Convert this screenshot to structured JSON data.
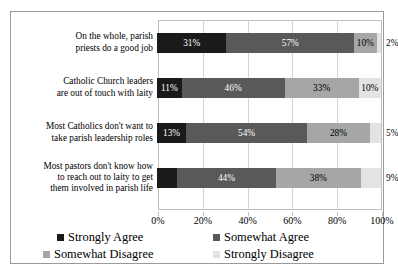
{
  "chart_data": {
    "type": "bar",
    "subtype": "stacked-horizontal-100pct",
    "title": "",
    "xlabel": "",
    "ylabel": "",
    "xlim": [
      0,
      100
    ],
    "xticks": [
      0,
      20,
      40,
      60,
      80,
      100
    ],
    "xtick_labels": [
      "0%",
      "20%",
      "40%",
      "60%",
      "80%",
      "100%"
    ],
    "grid": true,
    "grid_axis": "x",
    "legend_position": "bottom",
    "categories": [
      "On the whole, parish\npriests do a good job",
      "Catholic Church leaders\nare out of touch with laity",
      "Most Catholics don't want to\ntake parish leadership roles",
      "Most pastors don't know how\nto reach out to laity to get\nthem involved in parish life"
    ],
    "series": [
      {
        "name": "Strongly Agree",
        "color": "#1a1a1a",
        "values": [
          31,
          11,
          13,
          9
        ],
        "labels": [
          "31%",
          "11%",
          "13%",
          "9%"
        ]
      },
      {
        "name": "Somewhat Agree",
        "color": "#595959",
        "values": [
          57,
          46,
          54,
          44
        ],
        "labels": [
          "57%",
          "46%",
          "54%",
          "44%"
        ]
      },
      {
        "name": "Somewhat Disagree",
        "color": "#a6a6a6",
        "values": [
          10,
          33,
          28,
          38
        ],
        "labels": [
          "10%",
          "33%",
          "28%",
          "38%"
        ]
      },
      {
        "name": "Strongly Disagree",
        "color": "#e3e3e3",
        "values": [
          2,
          10,
          5,
          9
        ],
        "labels": [
          "2%",
          "10%",
          "5%",
          "9%"
        ]
      }
    ]
  },
  "legend": {
    "entries": [
      {
        "label": "Strongly Agree",
        "color": "#1a1a1a"
      },
      {
        "label": "Somewhat Agree",
        "color": "#595959"
      },
      {
        "label": "Somewhat Disagree",
        "color": "#a6a6a6"
      },
      {
        "label": "Strongly Disagree",
        "color": "#e3e3e3"
      }
    ]
  }
}
